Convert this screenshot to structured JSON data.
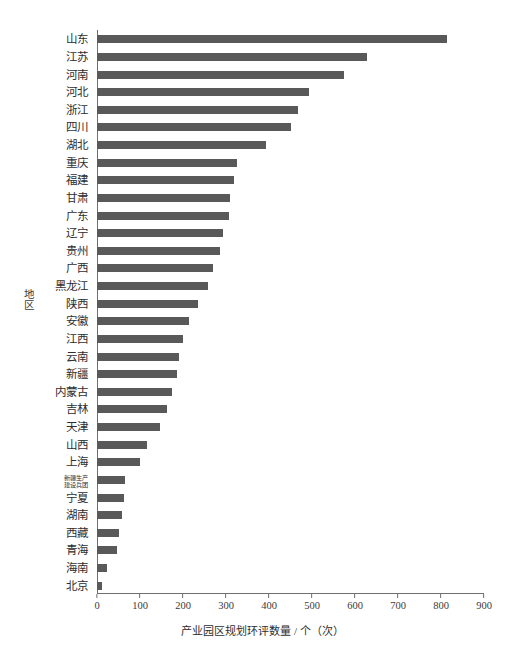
{
  "chart_data": {
    "type": "bar",
    "orientation": "horizontal",
    "title": "",
    "xlabel": "产业园区规划环评数量 / 个（次）",
    "ylabel": "地区",
    "xlim": [
      0,
      900
    ],
    "xticks": [
      0,
      100,
      200,
      300,
      400,
      500,
      600,
      700,
      800,
      900
    ],
    "grid": false,
    "legend": null,
    "bar_color": "#595959",
    "axis_color": "#6f6f6f",
    "categories": [
      "山东",
      "江苏",
      "河南",
      "河北",
      "浙江",
      "四川",
      "湖北",
      "重庆",
      "福建",
      "甘肃",
      "广东",
      "辽宁",
      "贵州",
      "广西",
      "黑龙江",
      "陕西",
      "安徽",
      "江西",
      "云南",
      "新疆",
      "内蒙古",
      "吉林",
      "天津",
      "山西",
      "上海",
      "新疆生产建设兵团",
      "宁夏",
      "湖南",
      "西藏",
      "青海",
      "海南",
      "北京"
    ],
    "values": [
      814,
      628,
      575,
      492,
      467,
      452,
      393,
      325,
      318,
      310,
      307,
      292,
      286,
      270,
      258,
      236,
      213,
      200,
      190,
      186,
      175,
      163,
      147,
      117,
      100,
      64,
      62,
      58,
      50,
      47,
      24,
      12
    ]
  },
  "axis": {
    "x_title": "产业园区规划环评数量 / 个（次）",
    "y_title": "地区"
  },
  "category_label_lines": {
    "新疆生产建设兵团": [
      "新疆生产",
      "建设兵团"
    ]
  }
}
